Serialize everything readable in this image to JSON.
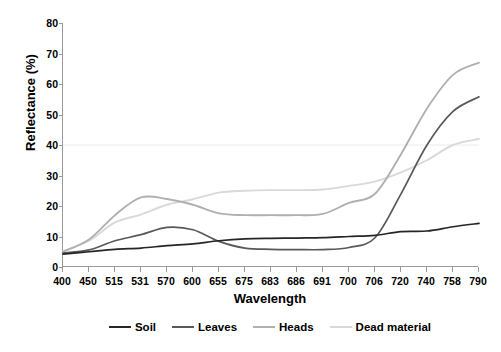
{
  "chart_data": {
    "type": "line",
    "title": "",
    "xlabel": "Wavelength",
    "ylabel": "Reflectance (%)",
    "ylim": [
      0,
      80
    ],
    "ytick_step": 10,
    "yticks": [
      0,
      10,
      20,
      30,
      40,
      50,
      60,
      70,
      80
    ],
    "grid": "horizontal-gridline-at-40-only",
    "legend_position": "bottom",
    "categories": [
      400,
      450,
      515,
      531,
      570,
      600,
      655,
      675,
      683,
      686,
      691,
      700,
      706,
      720,
      740,
      758,
      790
    ],
    "series": [
      {
        "name": "Soil",
        "color": "#262626",
        "values": [
          4.2,
          5.0,
          5.8,
          6.2,
          7.0,
          7.6,
          8.6,
          9.2,
          9.4,
          9.5,
          9.6,
          10.0,
          10.4,
          11.6,
          11.8,
          13.2,
          14.3
        ]
      },
      {
        "name": "Leaves",
        "color": "#595959",
        "values": [
          4.6,
          5.6,
          8.6,
          10.6,
          13.0,
          12.2,
          8.4,
          6.2,
          5.8,
          5.7,
          5.7,
          6.4,
          9.6,
          24.0,
          40.0,
          51.0,
          55.8
        ]
      },
      {
        "name": "Heads",
        "color": "#b0b0b0",
        "values": [
          5.0,
          9.0,
          17.0,
          22.8,
          22.3,
          20.4,
          17.6,
          17.0,
          17.0,
          17.0,
          17.4,
          21.0,
          24.0,
          37.0,
          52.0,
          63.0,
          67.0
        ]
      },
      {
        "name": "Dead material",
        "color": "#d9d9d9",
        "values": [
          5.2,
          8.6,
          14.6,
          17.2,
          20.4,
          22.2,
          24.4,
          25.0,
          25.2,
          25.2,
          25.4,
          26.6,
          28.0,
          31.0,
          35.0,
          40.0,
          42.0
        ]
      }
    ]
  },
  "legend": {
    "items": [
      {
        "label": "Soil",
        "color": "#262626"
      },
      {
        "label": "Leaves",
        "color": "#595959"
      },
      {
        "label": "Heads",
        "color": "#b0b0b0"
      },
      {
        "label": "Dead material",
        "color": "#d9d9d9"
      }
    ]
  }
}
